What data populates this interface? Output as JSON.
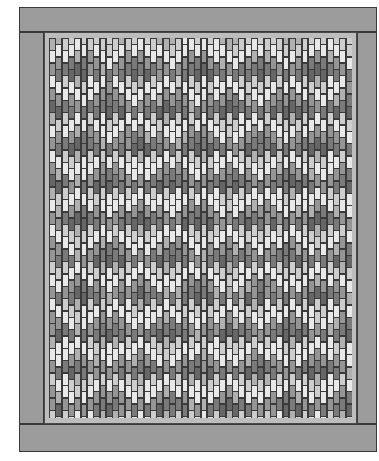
{
  "design": {
    "type": "brick-bargello quilt",
    "colors": {
      "outer_border": "#9c9c9c",
      "inner_border": "#bdbdbd",
      "grout": "#3a3a3a",
      "values": [
        "#e8e8e8",
        "#cdcdcd",
        "#b0b0b0",
        "#959595",
        "#7a7a7a",
        "#666666"
      ]
    },
    "outer": {
      "x": 0,
      "y": 0,
      "w": 358,
      "h": 445
    },
    "top_strip": {
      "x": 0,
      "y": 0,
      "w": 358,
      "h": 25
    },
    "bottom_strip": {
      "x": 0,
      "y": 417,
      "w": 358,
      "h": 28
    },
    "left_strip": {
      "x": 0,
      "y": 25,
      "w": 25,
      "h": 392
    },
    "right_strip": {
      "x": 338,
      "y": 25,
      "w": 20,
      "h": 392
    },
    "inner_border": {
      "x": 25,
      "y": 25,
      "w": 313,
      "h": 392
    },
    "field": {
      "x": 30,
      "y": 31,
      "w": 303,
      "h": 380
    },
    "grid": {
      "columns": 48,
      "brick_height": 12.4,
      "stagger": 6.2,
      "motif_period_x": 60,
      "motif_period_y": 75,
      "motif_offset_x": 30,
      "chevron_slope": 0.9
    }
  }
}
